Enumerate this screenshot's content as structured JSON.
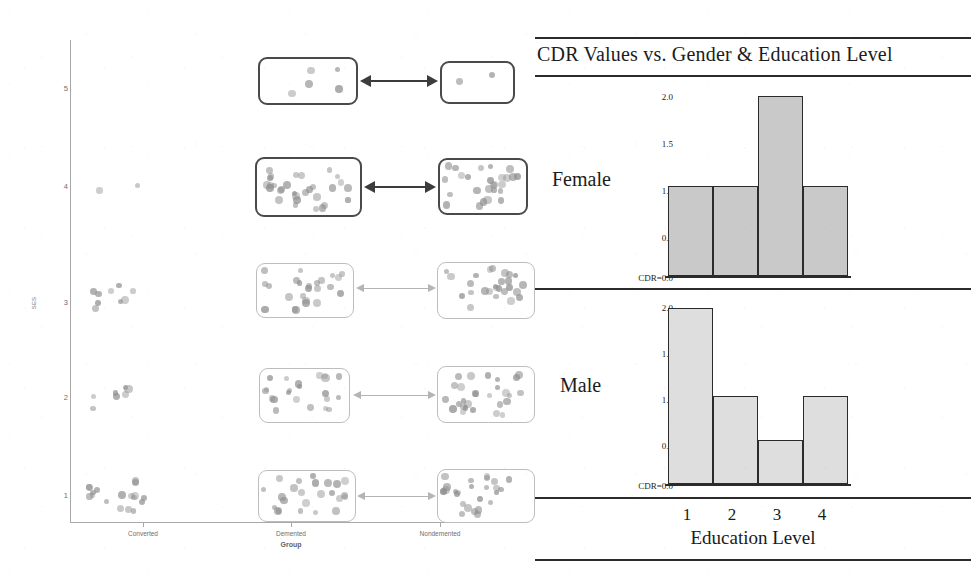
{
  "scatter": {
    "yaxis_title": "SES",
    "xaxis_title": "Group",
    "y_ticks": [
      "5",
      "4",
      "3",
      "2",
      "1"
    ],
    "x_ticks": [
      "Converted",
      "Demented",
      "Nondemented"
    ],
    "dot_color": "#8f8f8f",
    "box_strong_color": "#4a4a4a",
    "box_soft_color": "#bdbdbd",
    "arrow_strong_color": "#3c3c3c",
    "arrow_soft_color": "#b4b4b4"
  },
  "chart_data": {
    "type": "bar",
    "title": "CDR Values vs. Gender & Education Level",
    "xlabel": "Education Level",
    "ylabel": "CDR",
    "categories": [
      "1",
      "2",
      "3",
      "4"
    ],
    "ylim": [
      0,
      2.0
    ],
    "y_ticks": [
      "2.0",
      "1.5",
      "1.0",
      "0.5",
      "CDR=0.0"
    ],
    "grid": false,
    "legend": "none",
    "series": [
      {
        "name": "Female",
        "values": [
          1.0,
          1.0,
          2.0,
          1.0
        ]
      },
      {
        "name": "Male",
        "values": [
          2.0,
          1.0,
          0.5,
          1.0
        ]
      }
    ],
    "bar_fill": "#c9c9c9",
    "bar_edge": "#2b2b2b"
  }
}
